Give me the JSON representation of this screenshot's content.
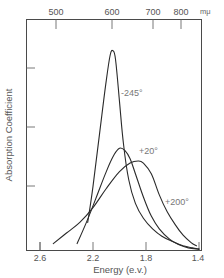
{
  "chart_data": {
    "type": "line",
    "title": "",
    "xlabel": "Energy (e.v.)",
    "ylabel": "Absorption  Coefficient",
    "x_axis": {
      "label": "Energy (e.v.)",
      "ticks": [
        2.6,
        2.2,
        1.8,
        1.4
      ],
      "tick_labels": [
        "2.6",
        "2.2",
        "1.8",
        "1.4"
      ],
      "range": [
        2.68,
        1.36
      ],
      "reversed": true
    },
    "secondary_x_axis": {
      "position": "top",
      "unit": "mμ",
      "ticks": [
        500,
        600,
        700,
        800
      ],
      "tick_labels": [
        "500",
        "600",
        "700",
        "800"
      ]
    },
    "y_axis": {
      "label": "Absorption  Coefficient",
      "tick_labels": [],
      "range": [
        0,
        1
      ],
      "ticks": [
        0.04,
        0.28,
        0.53,
        0.79
      ]
    },
    "grid": false,
    "legend": "inline labels",
    "series": [
      {
        "name": "-245°",
        "x": [
          2.24,
          2.2,
          2.15,
          2.1,
          2.07,
          2.05,
          2.03,
          2.0,
          1.97,
          1.93,
          1.88,
          1.82,
          1.75,
          1.68,
          1.6,
          1.52,
          1.45,
          1.4
        ],
        "y": [
          0.13,
          0.3,
          0.55,
          0.8,
          0.92,
          0.94,
          0.9,
          0.7,
          0.5,
          0.33,
          0.22,
          0.15,
          0.1,
          0.065,
          0.04,
          0.02,
          0.01,
          0.005
        ]
      },
      {
        "name": "+20°",
        "x": [
          2.32,
          2.25,
          2.18,
          2.1,
          2.04,
          2.0,
          1.96,
          1.92,
          1.88,
          1.82,
          1.76,
          1.7,
          1.62,
          1.55,
          1.48,
          1.4
        ],
        "y": [
          0.03,
          0.13,
          0.24,
          0.37,
          0.45,
          0.48,
          0.47,
          0.43,
          0.36,
          0.25,
          0.16,
          0.1,
          0.05,
          0.025,
          0.01,
          0.003
        ]
      },
      {
        "name": "+200°",
        "x": [
          2.5,
          2.4,
          2.3,
          2.2,
          2.1,
          2.0,
          1.92,
          1.86,
          1.82,
          1.76,
          1.7,
          1.64,
          1.58,
          1.52,
          1.46,
          1.42
        ],
        "y": [
          0.03,
          0.08,
          0.13,
          0.2,
          0.29,
          0.37,
          0.41,
          0.42,
          0.41,
          0.36,
          0.26,
          0.18,
          0.12,
          0.07,
          0.035,
          0.02
        ]
      }
    ],
    "annotations": [
      {
        "text": "-245°",
        "x": 1.96,
        "y": 0.67
      },
      {
        "text": "+20°",
        "x": 1.83,
        "y": 0.42
      },
      {
        "text": "+200°",
        "x": 1.62,
        "y": 0.21
      }
    ]
  },
  "labels": {
    "x_title": "Energy (e.v.)",
    "y_title": "Absorption  Coefficient",
    "top_unit": "mμ",
    "bottom_ticks": [
      "2.6",
      "2.2",
      "1.8",
      "1.4"
    ],
    "top_ticks": [
      "500",
      "600",
      "700",
      "800"
    ],
    "curve_labels": [
      "-245°",
      "+20°",
      "+200°"
    ]
  }
}
